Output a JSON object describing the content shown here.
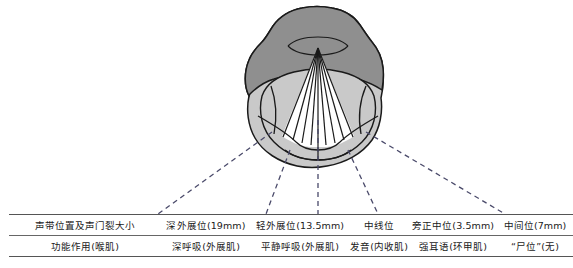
{
  "figure": {
    "name": "vocal-cord-position-diagram",
    "colors": {
      "epiglottis_fill": "#8f8f8f",
      "larynx_fill": "#c9c9c9",
      "glottis_fill": "#ffffff",
      "outline": "#1a1a1a",
      "leader_line": "#4a4a6a",
      "rule": "#555555"
    }
  },
  "table": {
    "rows": [
      {
        "name": "vocal-cord-position-row",
        "label": "声带位置及声门裂大小",
        "cells": [
          "深外展位(19mm)",
          "轻外展位(13.5mm)",
          "中线位",
          "旁正中位(3.5mm)",
          "中间位(7mm)"
        ]
      },
      {
        "name": "function-row",
        "label": "功能作用(喉肌)",
        "cells": [
          "深呼吸(外展肌)",
          "平静呼吸(外展肌)",
          "发音(内收肌)",
          "强耳语(环甲肌)",
          "“尸位”(无)"
        ]
      }
    ]
  }
}
